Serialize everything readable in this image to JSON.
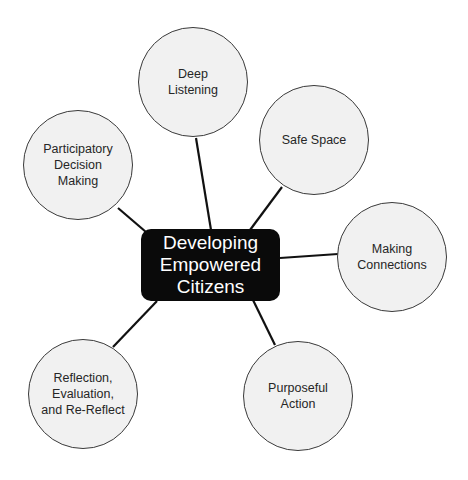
{
  "diagram": {
    "center": {
      "label": "Developing\nEmpowered\nCitizens"
    },
    "nodes": [
      {
        "id": "deep-listening",
        "label": "Deep\nListening",
        "cx": 193,
        "cy": 82,
        "r": 55,
        "link": [
          196,
          138,
          211,
          230
        ]
      },
      {
        "id": "safe-space",
        "label": "Safe Space",
        "cx": 314,
        "cy": 140,
        "r": 55,
        "link": [
          282,
          187,
          250,
          230
        ]
      },
      {
        "id": "making-connections",
        "label": "Making\nConnections",
        "cx": 392,
        "cy": 257,
        "r": 55,
        "link": [
          338,
          254,
          280,
          258
        ]
      },
      {
        "id": "purposeful-action",
        "label": "Purposeful\nAction",
        "cx": 298,
        "cy": 396,
        "r": 55,
        "link": [
          275,
          345,
          253,
          300
        ]
      },
      {
        "id": "reflection",
        "label": "Reflection,\nEvaluation,\nand Re-Reflect",
        "cx": 83,
        "cy": 394,
        "r": 55,
        "link": [
          113,
          347,
          157,
          301
        ]
      },
      {
        "id": "participatory-decision-making",
        "label": "Participatory\nDecision\nMaking",
        "cx": 78,
        "cy": 165,
        "r": 55,
        "link": [
          118,
          208,
          146,
          232
        ]
      }
    ],
    "colors": {
      "center_fill": "#0a0a0a",
      "node_fill": "#f1f1f1",
      "stroke": "#3a3a3a",
      "line": "#111111"
    }
  }
}
